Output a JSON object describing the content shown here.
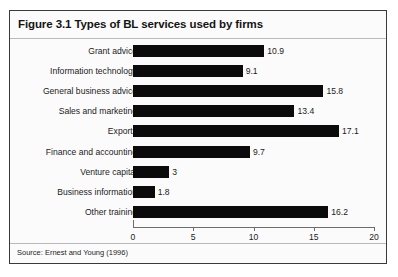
{
  "figure": {
    "title": "Figure 3.1 Types of BL services used by firms",
    "source": "Source: Ernest and Young (1996)"
  },
  "chart_data": {
    "type": "bar",
    "orientation": "horizontal",
    "title": "Figure 3.1 Types of BL services used by firms",
    "subtitle": "",
    "xlabel": "",
    "ylabel": "",
    "xlim": [
      0,
      20
    ],
    "xticks": [
      0,
      5,
      10,
      15,
      20
    ],
    "xtick_labels": [
      "0",
      "5",
      "10",
      "15",
      "20"
    ],
    "grid": false,
    "legend": "none",
    "bar_color": "#0b0b0b",
    "categories": [
      "Grant advice",
      "Information technology",
      "General business advice",
      "Sales and marketing",
      "Exports",
      "Finance and accounting",
      "Venture capital",
      "Business information",
      "Other training"
    ],
    "values": [
      10.9,
      9.1,
      15.8,
      13.4,
      17.1,
      9.7,
      3,
      1.8,
      16.2
    ],
    "value_labels": [
      "10.9",
      "9.1",
      "15.8",
      "13.4",
      "17.1",
      "9.7",
      "3",
      "1.8",
      "16.2"
    ]
  }
}
